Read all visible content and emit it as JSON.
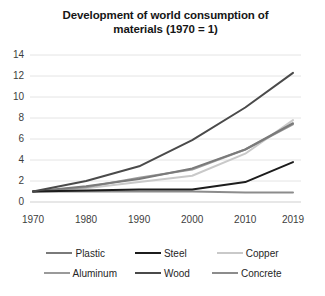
{
  "chart_data": {
    "type": "line",
    "title": "Development of world consumption of materials (1970 = 1)",
    "title_line1": "Development of world consumption of",
    "title_line2": "materials (1970 = 1)",
    "xlabel": "",
    "ylabel": "",
    "categories": [
      "1970",
      "1980",
      "1990",
      "2000",
      "2010",
      "2019"
    ],
    "x": [
      1970,
      1980,
      1990,
      2000,
      2010,
      2019
    ],
    "xlim": [
      1970,
      2019
    ],
    "ylim": [
      0,
      14
    ],
    "yticks": [
      0,
      2,
      4,
      6,
      8,
      10,
      12,
      14
    ],
    "grid": true,
    "grid_axis": "y",
    "legend_position": "bottom",
    "series": [
      {
        "name": "Plastic",
        "values": [
          1,
          1.5,
          2.2,
          3.2,
          5.0,
          7.5
        ],
        "color": "#7a7a7a"
      },
      {
        "name": "Steel",
        "values": [
          1,
          1.1,
          1.2,
          1.2,
          1.9,
          3.8
        ],
        "color": "#1c1c1c"
      },
      {
        "name": "Copper",
        "values": [
          1,
          1.3,
          1.9,
          2.5,
          4.6,
          7.8
        ],
        "color": "#c9c9c9"
      },
      {
        "name": "Aluminum",
        "values": [
          1,
          1.4,
          2.3,
          3.1,
          5.0,
          7.4
        ],
        "color": "#9a9a9a"
      },
      {
        "name": "Wood",
        "values": [
          1,
          2.0,
          3.4,
          5.9,
          9.0,
          12.3
        ],
        "color": "#4a4a4a"
      },
      {
        "name": "Concrete",
        "values": [
          1,
          1.0,
          1.0,
          1.0,
          0.9,
          0.9
        ],
        "color": "#8c8c8c"
      }
    ]
  },
  "legend": {
    "rows": [
      [
        "Plastic",
        "Steel",
        "Copper"
      ],
      [
        "Aluminum",
        "Wood",
        "Concrete"
      ]
    ]
  }
}
